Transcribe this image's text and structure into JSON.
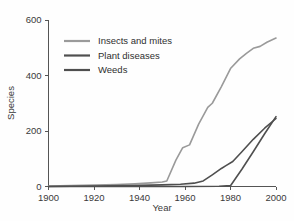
{
  "chart_data": {
    "type": "line",
    "title": "",
    "xlabel": "Year",
    "ylabel": "Species",
    "xlim": [
      1900,
      2000
    ],
    "ylim": [
      0,
      600
    ],
    "xticks": [
      1900,
      1920,
      1940,
      1960,
      1980,
      2000
    ],
    "yticks": [
      0,
      200,
      400,
      600
    ],
    "xtick_labels": [
      "1900",
      "1920",
      "1940",
      "1960",
      "1980",
      "2000"
    ],
    "ytick_labels": [
      "0",
      "200",
      "400",
      "600"
    ],
    "grid": false,
    "legend_position": "upper-left-inside",
    "series": [
      {
        "name": "Insects and mites",
        "color": "#9a9a9a",
        "x": [
          1900,
          1910,
          1920,
          1930,
          1938,
          1945,
          1950,
          1952,
          1956,
          1959,
          1962,
          1966,
          1970,
          1972,
          1976,
          1980,
          1984,
          1987,
          1990,
          1993,
          1996,
          2000
        ],
        "y": [
          2,
          3,
          5,
          7,
          10,
          13,
          16,
          20,
          95,
          140,
          150,
          225,
          285,
          300,
          360,
          425,
          460,
          480,
          498,
          505,
          520,
          535
        ]
      },
      {
        "name": "Plant diseases",
        "color": "#4f4f4f",
        "x": [
          1900,
          1920,
          1940,
          1950,
          1958,
          1964,
          1968,
          1972,
          1976,
          1978,
          1981,
          1985,
          1990,
          1995,
          2000
        ],
        "y": [
          0,
          2,
          4,
          6,
          8,
          12,
          20,
          42,
          65,
          75,
          90,
          125,
          170,
          210,
          245
        ]
      },
      {
        "name": "Weeds",
        "color": "#4f4f4f",
        "x": [
          1900,
          1920,
          1940,
          1960,
          1975,
          1980,
          1985,
          1990,
          1995,
          2000
        ],
        "y": [
          0,
          0,
          0,
          0,
          1,
          3,
          62,
          125,
          190,
          252
        ]
      }
    ],
    "legend_entries": [
      {
        "label": "Insects and mites",
        "color": "#9a9a9a"
      },
      {
        "label": "Plant diseases",
        "color": "#4f4f4f"
      },
      {
        "label": "Weeds",
        "color": "#4f4f4f"
      }
    ]
  },
  "colors": {
    "background": "#fefefe",
    "axis": "#555555",
    "text": "#3a3a3a",
    "insects": "#9a9a9a",
    "plant_diseases": "#4f4f4f",
    "weeds": "#4f4f4f"
  }
}
